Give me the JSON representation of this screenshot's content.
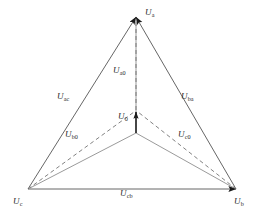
{
  "figure": {
    "type": "phasor-diagram",
    "title": "",
    "background_color": "#ffffff",
    "line_color": "#555555",
    "dashed_color": "#6b6b6b",
    "arrow_color": "#1a1a1a",
    "text_color": "#2b2b2b"
  },
  "labels": {
    "vertex_a": {
      "symbol": "U",
      "sub": "a",
      "x": 145,
      "y": 8
    },
    "vertex_b": {
      "symbol": "U",
      "sub": "b",
      "x": 234,
      "y": 198
    },
    "vertex_c": {
      "symbol": "U",
      "sub": "c",
      "x": 14,
      "y": 198
    },
    "neutral": {
      "symbol": "U",
      "sub": "0",
      "x": 118,
      "y": 113
    },
    "phase_a0": {
      "symbol": "U",
      "sub": "a0",
      "x": 113,
      "y": 67
    },
    "phase_b0": {
      "symbol": "U",
      "sub": "b0",
      "x": 66,
      "y": 131
    },
    "phase_c0": {
      "symbol": "U",
      "sub": "c0",
      "x": 178,
      "y": 131
    },
    "line_ac": {
      "symbol": "U",
      "sub": "ac",
      "x": 58,
      "y": 93
    },
    "line_ba": {
      "symbol": "U",
      "sub": "ba",
      "x": 182,
      "y": 93
    },
    "line_cb": {
      "symbol": "U",
      "sub": "cb",
      "x": 121,
      "y": 190
    }
  },
  "geometry": {
    "vertex_a": {
      "x": 136,
      "y": 17
    },
    "vertex_b": {
      "x": 236,
      "y": 189
    },
    "vertex_c": {
      "x": 28,
      "y": 189
    },
    "origin": {
      "x": 136,
      "y": 133
    },
    "neutral_tip": {
      "x": 136,
      "y": 110
    }
  },
  "legend": {
    "solid_meaning": "line voltage / reference phasor",
    "dashed_meaning": "phase voltage relative to displaced neutral"
  }
}
